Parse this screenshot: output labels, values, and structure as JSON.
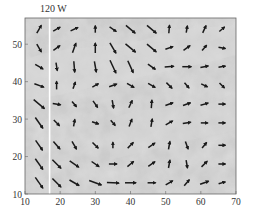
{
  "chart_data": {
    "type": "quiver",
    "title": "",
    "annotation": "120 W",
    "annotation_x": 17,
    "xlabel": "",
    "ylabel": "",
    "xlim": [
      10,
      70
    ],
    "ylim": [
      10,
      57
    ],
    "xticks": [
      10,
      20,
      30,
      40,
      50,
      60,
      70
    ],
    "yticks": [
      10,
      20,
      30,
      40,
      50
    ],
    "grid": false,
    "background": "grayscale satellite image",
    "vertical_line": {
      "x": 17,
      "color": "#ffffff"
    },
    "arrow_color": "#1a1a1a",
    "frame_color": "#666666",
    "vectors_note": "Arrow angles in degrees (screen: 0 = right, positive = clockwise/down), length in px",
    "rows": [
      {
        "y": 54,
        "vectors": [
          {
            "x": 14,
            "a": -60,
            "l": 9
          },
          {
            "x": 19,
            "a": -30,
            "l": 8
          },
          {
            "x": 24,
            "a": -25,
            "l": 8
          },
          {
            "x": 30,
            "a": -90,
            "l": 7
          },
          {
            "x": 35,
            "a": 35,
            "l": 8
          },
          {
            "x": 40,
            "a": 40,
            "l": 12
          },
          {
            "x": 46,
            "a": 40,
            "l": 12
          },
          {
            "x": 51,
            "a": -85,
            "l": 8
          },
          {
            "x": 56,
            "a": -80,
            "l": 7
          },
          {
            "x": 61,
            "a": -65,
            "l": 8
          },
          {
            "x": 66,
            "a": -40,
            "l": 7
          }
        ]
      },
      {
        "y": 49,
        "vectors": [
          {
            "x": 14,
            "a": 60,
            "l": 9
          },
          {
            "x": 19,
            "a": -35,
            "l": 8
          },
          {
            "x": 24,
            "a": -70,
            "l": 10
          },
          {
            "x": 30,
            "a": -90,
            "l": 10
          },
          {
            "x": 35,
            "a": 60,
            "l": 12
          },
          {
            "x": 40,
            "a": 40,
            "l": 13
          },
          {
            "x": 46,
            "a": 40,
            "l": 12
          },
          {
            "x": 51,
            "a": -20,
            "l": 8
          },
          {
            "x": 56,
            "a": -35,
            "l": 8
          },
          {
            "x": 61,
            "a": -50,
            "l": 7
          },
          {
            "x": 66,
            "a": 10,
            "l": 7
          }
        ]
      },
      {
        "y": 44,
        "vectors": [
          {
            "x": 14,
            "a": 30,
            "l": 9
          },
          {
            "x": 19,
            "a": 80,
            "l": 8
          },
          {
            "x": 24,
            "a": 85,
            "l": 11
          },
          {
            "x": 30,
            "a": 80,
            "l": 11
          },
          {
            "x": 35,
            "a": 65,
            "l": 14
          },
          {
            "x": 40,
            "a": 65,
            "l": 13
          },
          {
            "x": 46,
            "a": 35,
            "l": 9
          },
          {
            "x": 51,
            "a": -5,
            "l": 9
          },
          {
            "x": 56,
            "a": 0,
            "l": 9
          },
          {
            "x": 61,
            "a": -10,
            "l": 8
          },
          {
            "x": 66,
            "a": -10,
            "l": 7
          }
        ]
      },
      {
        "y": 39,
        "vectors": [
          {
            "x": 14,
            "a": 20,
            "l": 10
          },
          {
            "x": 19,
            "a": -90,
            "l": 8
          },
          {
            "x": 24,
            "a": -70,
            "l": 7
          },
          {
            "x": 30,
            "a": -30,
            "l": 7
          },
          {
            "x": 35,
            "a": -20,
            "l": 8
          },
          {
            "x": 40,
            "a": 30,
            "l": 8
          },
          {
            "x": 46,
            "a": 30,
            "l": 8
          },
          {
            "x": 51,
            "a": 45,
            "l": 8
          },
          {
            "x": 56,
            "a": 50,
            "l": 7
          },
          {
            "x": 61,
            "a": 25,
            "l": 7
          },
          {
            "x": 66,
            "a": 45,
            "l": 7
          }
        ]
      },
      {
        "y": 34,
        "vectors": [
          {
            "x": 14,
            "a": 40,
            "l": 14
          },
          {
            "x": 19,
            "a": 10,
            "l": 8
          },
          {
            "x": 24,
            "a": 50,
            "l": 7
          },
          {
            "x": 30,
            "a": 55,
            "l": 8
          },
          {
            "x": 35,
            "a": 80,
            "l": 8
          },
          {
            "x": 40,
            "a": -65,
            "l": 8
          },
          {
            "x": 46,
            "a": -85,
            "l": 8
          },
          {
            "x": 51,
            "a": -20,
            "l": 8
          },
          {
            "x": 56,
            "a": -20,
            "l": 8
          },
          {
            "x": 61,
            "a": -15,
            "l": 8
          },
          {
            "x": 66,
            "a": 0,
            "l": 7
          }
        ]
      },
      {
        "y": 29,
        "vectors": [
          {
            "x": 14,
            "a": 55,
            "l": 13
          },
          {
            "x": 19,
            "a": 45,
            "l": 8
          },
          {
            "x": 24,
            "a": -80,
            "l": 7
          },
          {
            "x": 30,
            "a": 20,
            "l": 7
          },
          {
            "x": 35,
            "a": 50,
            "l": 7
          },
          {
            "x": 40,
            "a": -70,
            "l": 8
          },
          {
            "x": 46,
            "a": -80,
            "l": 8
          },
          {
            "x": 51,
            "a": -30,
            "l": 8
          },
          {
            "x": 56,
            "a": -10,
            "l": 8
          },
          {
            "x": 61,
            "a": 0,
            "l": 7
          },
          {
            "x": 66,
            "a": 0,
            "l": 7
          }
        ]
      },
      {
        "y": 23,
        "vectors": [
          {
            "x": 14,
            "a": 55,
            "l": 12
          },
          {
            "x": 19,
            "a": 50,
            "l": 10
          },
          {
            "x": 24,
            "a": 60,
            "l": 9
          },
          {
            "x": 30,
            "a": 45,
            "l": 8
          },
          {
            "x": 35,
            "a": -90,
            "l": 6
          },
          {
            "x": 40,
            "a": -45,
            "l": 8
          },
          {
            "x": 46,
            "a": -35,
            "l": 8
          },
          {
            "x": 51,
            "a": -80,
            "l": 8
          },
          {
            "x": 56,
            "a": 70,
            "l": 8
          },
          {
            "x": 61,
            "a": -50,
            "l": 7
          },
          {
            "x": 66,
            "a": 0,
            "l": 7
          }
        ]
      },
      {
        "y": 18,
        "vectors": [
          {
            "x": 14,
            "a": 55,
            "l": 13
          },
          {
            "x": 19,
            "a": 45,
            "l": 12
          },
          {
            "x": 24,
            "a": 35,
            "l": 11
          },
          {
            "x": 30,
            "a": 35,
            "l": 9
          },
          {
            "x": 35,
            "a": 0,
            "l": 8
          },
          {
            "x": 40,
            "a": -40,
            "l": 8
          },
          {
            "x": 46,
            "a": -35,
            "l": 8
          },
          {
            "x": 51,
            "a": -80,
            "l": 8
          },
          {
            "x": 56,
            "a": 80,
            "l": 8
          },
          {
            "x": 61,
            "a": -45,
            "l": 8
          },
          {
            "x": 66,
            "a": 0,
            "l": 7
          }
        ]
      },
      {
        "y": 13,
        "vectors": [
          {
            "x": 14,
            "a": 55,
            "l": 13
          },
          {
            "x": 19,
            "a": 45,
            "l": 12
          },
          {
            "x": 24,
            "a": 30,
            "l": 11
          },
          {
            "x": 30,
            "a": 20,
            "l": 13
          },
          {
            "x": 35,
            "a": 3,
            "l": 12
          },
          {
            "x": 40,
            "a": 0,
            "l": 11
          },
          {
            "x": 46,
            "a": 0,
            "l": 8
          },
          {
            "x": 51,
            "a": -30,
            "l": 8
          },
          {
            "x": 56,
            "a": -50,
            "l": 8
          },
          {
            "x": 61,
            "a": -20,
            "l": 9
          },
          {
            "x": 66,
            "a": -15,
            "l": 7
          }
        ]
      }
    ]
  }
}
